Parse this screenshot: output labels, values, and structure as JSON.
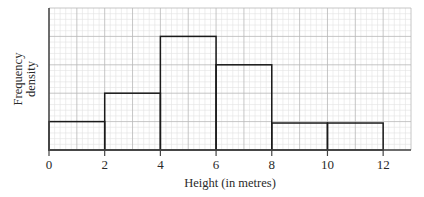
{
  "chart_data": {
    "type": "histogram",
    "title": "",
    "xlabel": "Height (in metres)",
    "ylabel": [
      "Frequency",
      "density"
    ],
    "x_ticks": [
      0,
      2,
      4,
      6,
      8,
      10,
      12
    ],
    "xlim": [
      0,
      13
    ],
    "ylim": [
      0,
      5
    ],
    "y_ticks_labeled": false,
    "grid": {
      "major_x_step": 1,
      "major_y_step": 1,
      "minor_divisions": 5
    },
    "bins": [
      {
        "from": 0,
        "to": 2,
        "frequency_density": 1
      },
      {
        "from": 2,
        "to": 4,
        "frequency_density": 2
      },
      {
        "from": 4,
        "to": 6,
        "frequency_density": 4
      },
      {
        "from": 6,
        "to": 8,
        "frequency_density": 3
      },
      {
        "from": 8,
        "to": 10,
        "frequency_density": 0.95
      },
      {
        "from": 10,
        "to": 12,
        "frequency_density": 0.95
      }
    ],
    "legend": null
  },
  "colors": {
    "minor_grid": "#e3e3e3",
    "major_grid": "#b8b8b8",
    "bar_outline": "#1a1a1a",
    "axis": "#444444",
    "text": "#2a2a2a"
  }
}
